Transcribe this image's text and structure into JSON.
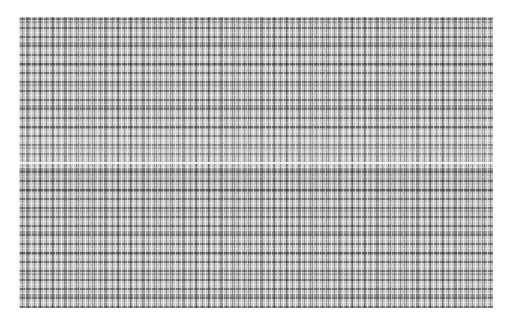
{
  "image": {
    "description": "abstract grayscale dotted/striped texture pattern",
    "colors": {
      "background": "#ffffff",
      "pattern_base": "#c9c9c9",
      "dark_marks": "#2a2a2a",
      "center_line": "#ffffff"
    },
    "pattern_bounds": {
      "x": 19,
      "y": 17,
      "width": 474,
      "height": 291
    },
    "center_line_y": 163
  }
}
